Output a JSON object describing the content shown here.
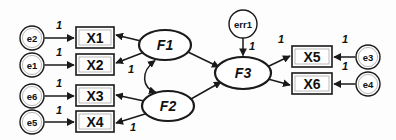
{
  "diagram": {
    "type": "structural-equation-model-path-diagram",
    "title": "",
    "background_color": "#fdfdfd",
    "stroke_color": "#1a1a1a",
    "fill_color": "#ffffff",
    "nodes": {
      "errors": [
        {
          "id": "e2",
          "label": "e2",
          "shape": "circle",
          "cx": 32,
          "cy": 38,
          "r": 12
        },
        {
          "id": "e1",
          "label": "e1",
          "shape": "circle",
          "cx": 32,
          "cy": 65,
          "r": 12
        },
        {
          "id": "e6",
          "label": "e6",
          "shape": "circle",
          "cx": 32,
          "cy": 96,
          "r": 12
        },
        {
          "id": "e5",
          "label": "e5",
          "shape": "circle",
          "cx": 32,
          "cy": 122,
          "r": 12
        },
        {
          "id": "e3",
          "label": "e3",
          "shape": "circle",
          "cx": 368,
          "cy": 57,
          "r": 12
        },
        {
          "id": "e4",
          "label": "e4",
          "shape": "circle",
          "cx": 368,
          "cy": 84,
          "r": 12
        },
        {
          "id": "err1",
          "label": "err1",
          "shape": "circle",
          "cx": 243,
          "cy": 24,
          "r": 14
        }
      ],
      "manifest": [
        {
          "id": "X1",
          "label": "X1",
          "shape": "rect",
          "x": 76,
          "y": 27,
          "w": 38,
          "h": 21
        },
        {
          "id": "X2",
          "label": "X2",
          "shape": "rect",
          "x": 76,
          "y": 54,
          "w": 38,
          "h": 21
        },
        {
          "id": "X3",
          "label": "X3",
          "shape": "rect",
          "x": 76,
          "y": 85,
          "w": 38,
          "h": 21
        },
        {
          "id": "X4",
          "label": "X4",
          "shape": "rect",
          "x": 76,
          "y": 111,
          "w": 38,
          "h": 21
        },
        {
          "id": "X5",
          "label": "X5",
          "shape": "rect",
          "x": 292,
          "y": 46,
          "w": 40,
          "h": 21
        },
        {
          "id": "X6",
          "label": "X6",
          "shape": "rect",
          "x": 292,
          "y": 73,
          "w": 40,
          "h": 21
        }
      ],
      "latent": [
        {
          "id": "F1",
          "label": "F1",
          "shape": "ellipse",
          "cx": 165,
          "cy": 45,
          "rx": 26,
          "ry": 15
        },
        {
          "id": "F2",
          "label": "F2",
          "shape": "ellipse",
          "cx": 168,
          "cy": 106,
          "rx": 26,
          "ry": 15
        },
        {
          "id": "F3",
          "label": "F3",
          "shape": "ellipse",
          "cx": 243,
          "cy": 73,
          "rx": 28,
          "ry": 16
        }
      ]
    },
    "edges": [
      {
        "id": "e2-to-X1",
        "from": "e2",
        "to": "X1",
        "kind": "directed",
        "coefficient": "1"
      },
      {
        "id": "e1-to-X2",
        "from": "e1",
        "to": "X2",
        "kind": "directed",
        "coefficient": "1"
      },
      {
        "id": "e6-to-X3",
        "from": "e6",
        "to": "X3",
        "kind": "directed",
        "coefficient": "1"
      },
      {
        "id": "e5-to-X4",
        "from": "e5",
        "to": "X4",
        "kind": "directed",
        "coefficient": "1"
      },
      {
        "id": "e3-to-X5",
        "from": "e3",
        "to": "X5",
        "kind": "directed",
        "coefficient": "1"
      },
      {
        "id": "e4-to-X6",
        "from": "e4",
        "to": "X6",
        "kind": "directed",
        "coefficient": "1"
      },
      {
        "id": "err1-to-F3",
        "from": "err1",
        "to": "F3",
        "kind": "directed",
        "coefficient": "1"
      },
      {
        "id": "F1-to-X1",
        "from": "F1",
        "to": "X1",
        "kind": "directed",
        "coefficient": ""
      },
      {
        "id": "F1-to-X2",
        "from": "F1",
        "to": "X2",
        "kind": "directed",
        "coefficient": "1"
      },
      {
        "id": "F2-to-X3",
        "from": "F2",
        "to": "X3",
        "kind": "directed",
        "coefficient": ""
      },
      {
        "id": "F2-to-X4",
        "from": "F2",
        "to": "X4",
        "kind": "directed",
        "coefficient": "1"
      },
      {
        "id": "F1-to-F3",
        "from": "F1",
        "to": "F3",
        "kind": "directed",
        "coefficient": ""
      },
      {
        "id": "F2-to-F3",
        "from": "F2",
        "to": "F3",
        "kind": "directed",
        "coefficient": ""
      },
      {
        "id": "F3-to-X5",
        "from": "F3",
        "to": "X5",
        "kind": "directed",
        "coefficient": "1"
      },
      {
        "id": "F3-to-X6",
        "from": "F3",
        "to": "X6",
        "kind": "directed",
        "coefficient": ""
      },
      {
        "id": "F1-F2-cov",
        "from": "F1",
        "to": "F2",
        "kind": "double-headed-curve",
        "coefficient": ""
      }
    ],
    "coefficient_labels": [
      {
        "id": "coef-e2-X1",
        "text": "1",
        "x": 59,
        "y": 25
      },
      {
        "id": "coef-e1-X2",
        "text": "1",
        "x": 59,
        "y": 52
      },
      {
        "id": "coef-e6-X3",
        "text": "1",
        "x": 59,
        "y": 83
      },
      {
        "id": "coef-e5-X4",
        "text": "1",
        "x": 59,
        "y": 110
      },
      {
        "id": "coef-F1-X2",
        "text": "1",
        "x": 131,
        "y": 69
      },
      {
        "id": "coef-F2-X4",
        "text": "1",
        "x": 133,
        "y": 127
      },
      {
        "id": "coef-err1-F3",
        "text": "1",
        "x": 252,
        "y": 46
      },
      {
        "id": "coef-F3-X5",
        "text": "1",
        "x": 281,
        "y": 39
      },
      {
        "id": "coef-e3-X5",
        "text": "1",
        "x": 345,
        "y": 39
      },
      {
        "id": "coef-e4-X6",
        "text": "1",
        "x": 345,
        "y": 66
      }
    ]
  }
}
